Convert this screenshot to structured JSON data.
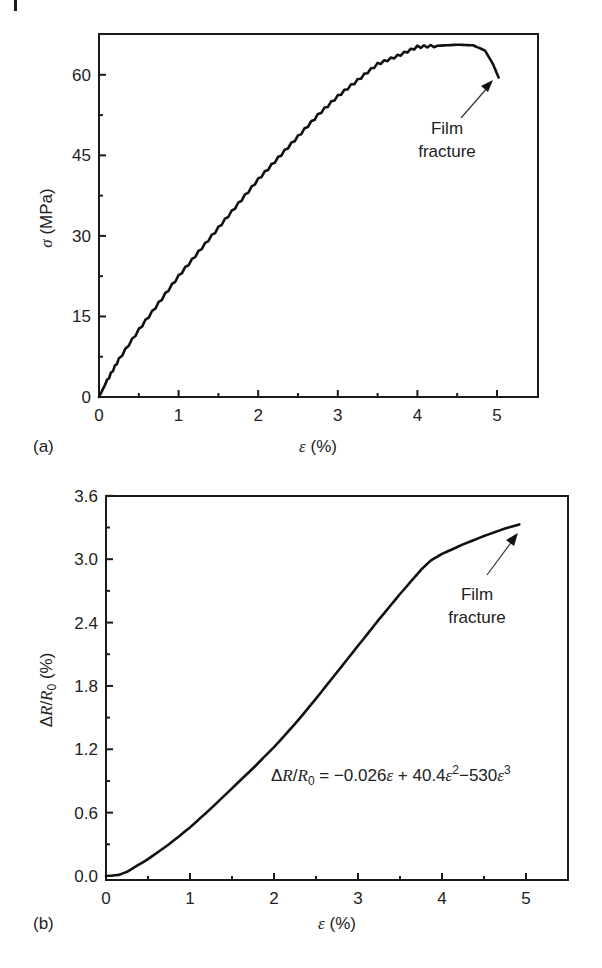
{
  "chart_data": [
    {
      "panel": "(a)",
      "type": "line",
      "title": "",
      "xlabel": "ε (%)",
      "ylabel": "σ (MPa)",
      "xlim": [
        0,
        5.5
      ],
      "ylim": [
        0,
        67
      ],
      "xticks": [
        0,
        1,
        2,
        3,
        4,
        5
      ],
      "xtick_labels": [
        "0",
        "1",
        "2",
        "3",
        "4",
        "5"
      ],
      "yticks": [
        0,
        15,
        30,
        45,
        60
      ],
      "ytick_labels": [
        "0",
        "15",
        "30",
        "45",
        "60"
      ],
      "grid": false,
      "legend": null,
      "series": [
        {
          "name": "stress-strain",
          "x": [
            0,
            0.1,
            0.25,
            0.5,
            0.75,
            1.0,
            1.25,
            1.5,
            1.75,
            2.0,
            2.25,
            2.5,
            2.75,
            3.0,
            3.25,
            3.5,
            3.75,
            4.0,
            4.25,
            4.5,
            4.7,
            4.85,
            4.95,
            5.02
          ],
          "y": [
            0,
            3,
            7,
            12.5,
            17.5,
            22.5,
            27,
            31.5,
            36,
            40.5,
            44.5,
            48.5,
            52.5,
            56,
            59,
            62,
            63.5,
            65.2,
            65.4,
            65.6,
            65.5,
            64.5,
            62,
            59.5
          ]
        }
      ],
      "annotations": [
        {
          "text_line1": "Film",
          "text_line2": "fracture",
          "arrow_to": [
            4.95,
            63
          ]
        }
      ]
    },
    {
      "panel": "(b)",
      "type": "line",
      "title": "",
      "xlabel": "ε (%)",
      "ylabel": "ΔR/R0 (%)",
      "xlim": [
        0,
        5.5
      ],
      "ylim": [
        -0.04,
        3.6
      ],
      "xticks": [
        0,
        1,
        2,
        3,
        4,
        5
      ],
      "xtick_labels": [
        "0",
        "1",
        "2",
        "3",
        "4",
        "5"
      ],
      "yticks": [
        0.0,
        0.6,
        1.2,
        1.8,
        2.4,
        3.0,
        3.6
      ],
      "ytick_labels": [
        "0.0",
        "0.6",
        "1.2",
        "1.8",
        "2.4",
        "3.0",
        "3.6"
      ],
      "grid": false,
      "legend": null,
      "series": [
        {
          "name": "resistance change",
          "x": [
            0,
            0.15,
            0.25,
            0.5,
            0.75,
            1.0,
            1.25,
            1.5,
            1.75,
            2.0,
            2.25,
            2.5,
            2.75,
            3.0,
            3.25,
            3.5,
            3.75,
            3.87,
            4.0,
            4.25,
            4.5,
            4.75,
            4.92
          ],
          "y": [
            0.0,
            0.01,
            0.04,
            0.16,
            0.3,
            0.46,
            0.64,
            0.83,
            1.02,
            1.22,
            1.44,
            1.68,
            1.93,
            2.18,
            2.43,
            2.67,
            2.9,
            2.99,
            3.05,
            3.14,
            3.22,
            3.29,
            3.33
          ]
        }
      ],
      "annotations": [
        {
          "text_line1": "Film",
          "text_line2": "fracture",
          "arrow_to": [
            4.9,
            3.3
          ]
        },
        {
          "equation": "ΔR/R0 = −0.026ε + 40.4ε²−530ε³"
        }
      ]
    }
  ],
  "panels": {
    "a": {
      "label": "(a)",
      "ylabel_sym": "σ",
      "ylabel_unit": " (MPa)",
      "xlabel_sym": "ε",
      "xlabel_unit": " (%)",
      "annot_line1": "Film",
      "annot_line2": "fracture"
    },
    "b": {
      "label": "(b)",
      "ylabel_delta": "Δ",
      "ylabel_R": "R",
      "ylabel_slash": "/",
      "ylabel_R0": "R",
      "ylabel_sub0": "0",
      "ylabel_unit": " (%)",
      "xlabel_sym": "ε",
      "xlabel_unit": " (%)",
      "annot_line1": "Film",
      "annot_line2": "fracture",
      "eq_lhs_delta": "Δ",
      "eq_lhs_R": "R",
      "eq_lhs_slash": "/",
      "eq_lhs_R0": "R",
      "eq_lhs_sub0": "0",
      "eq_part1": " = −0.026",
      "eq_eps1": "ε",
      "eq_part2": " + 40.4",
      "eq_eps2": "ε",
      "eq_sup2": "2",
      "eq_part3": "−530",
      "eq_eps3": "ε",
      "eq_sup3": "3"
    }
  }
}
